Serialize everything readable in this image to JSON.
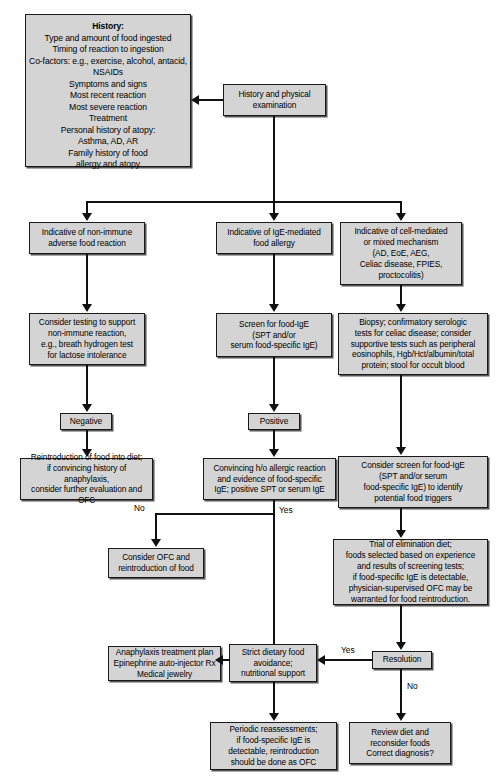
{
  "diagram": {
    "type": "flowchart",
    "colors": {
      "node_fill": "#d4d4d4",
      "node_border": "#1a1a1a",
      "connector": "#111111",
      "background": "#ffffff"
    },
    "nodes": {
      "history": "History:\nType and amount of food ingested\nTiming of reaction to ingestion\nCo-factors: e.g., exercise, alcohol, antacid,\nNSAIDs\nSymptoms and signs\nMost recent reaction\nMost severe reaction\nTreatment\nPersonal history of atopy:\nAsthma, AD, AR\nFamily history of food\nallergy and atopy",
      "history_heading": "History:",
      "start": "History and physical\nexamination",
      "branch_nonimmune": "Indicative of non-immune\nadverse food reaction",
      "branch_ige": "Indicative of IgE-mediated\nfood allergy",
      "branch_cellmediated": "Indicative of cell-mediated\nor mixed mechanism\n(AD, EoE, AEG,\nCeliac disease, FPIES,\nproctocolitis)",
      "consider_testing": "Consider testing to support\nnon-immune reaction,\ne.g., breath hydrogen test\nfor lactose intolerance",
      "screen_ige": "Screen for food-IgE\n(SPT and/or\nserum food-specific IgE)",
      "biopsy": "Biopsy; confirmatory serologic\ntests for celiac disease; consider\nsupportive tests such as peripheral\neosinophils, Hgb/Hct/albumin/total\nprotein; stool for occult blood",
      "negative": "Negative",
      "positive": "Positive",
      "reintroduction": "Reintroduction of food into diet;\nif convincing history of anaphylaxis,\nconsider further evaluation and OFC",
      "convincing": "Convincing h/o allergic reaction\nand evidence of food-specific\nIgE; positive SPT or serum IgE",
      "consider_screen": "Consider screen for food-IgE\n(SPT and/or serum\nfood-specific IgE) to identify\npotential food triggers",
      "consider_ofc": "Consider OFC and\nreintroduction of food",
      "elimination_diet": "Trial of elimination diet;\nfoods selected based on experience\nand results of screening tests;\nif food-specific IgE is detectable,\nphysician-supervised OFC may be\nwarranted for food reintroduction.",
      "anaphylaxis_plan": "Anaphylaxis treatment plan\nEpinephrine auto-injector Rx\nMedical jewelry",
      "strict_avoidance": "Strict dietary food\navoidance;\nnutritional support",
      "resolution": "Resolution",
      "periodic": "Periodic reassessments;\nif food-specific IgE is\ndetectable, reintroduction\nshould be done as OFC",
      "review_diet": "Review diet and\nreconsider foods\nCorrect diagnosis?"
    },
    "edge_labels": {
      "no_left": "No",
      "yes_center": "Yes",
      "yes_right": "Yes",
      "no_bottom": "No"
    }
  }
}
